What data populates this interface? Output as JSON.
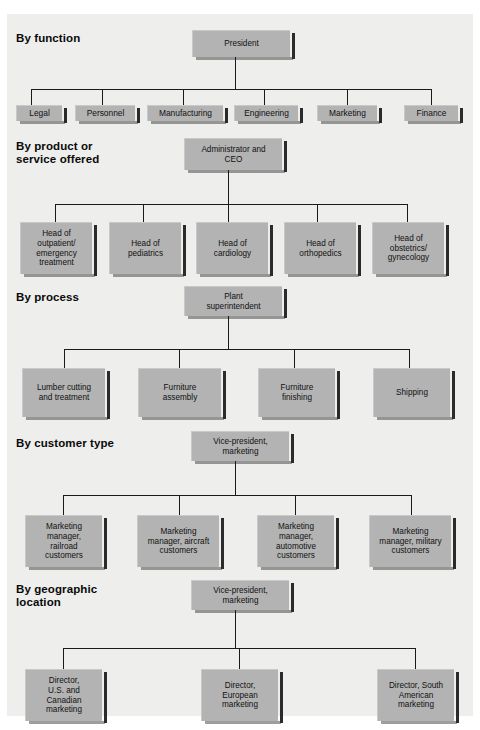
{
  "figure": {
    "kind": "organization-chart-collection",
    "panel_background": "#eeeeec",
    "node_fill": "#b3b3b3",
    "line_color": "#1a1a1a"
  },
  "sections": [
    {
      "id": "by-function",
      "title": "By function",
      "root": "President",
      "children": [
        "Legal",
        "Personnel",
        "Manufacturing",
        "Engineering",
        "Marketing",
        "Finance"
      ]
    },
    {
      "id": "by-product",
      "title": "By product or\nservice offered",
      "root": "Administrator and\nCEO",
      "children": [
        "Head of\noutpatient/\nemergency\ntreatment",
        "Head of\npediatrics",
        "Head of\ncardiology",
        "Head of\northopedics",
        "Head of\nobstetrics/\ngynecology"
      ]
    },
    {
      "id": "by-process",
      "title": "By process",
      "root": "Plant\nsuperintendent",
      "children": [
        "Lumber cutting\nand treatment",
        "Furniture\nassembly",
        "Furniture\nfinishing",
        "Shipping"
      ]
    },
    {
      "id": "by-customer-type",
      "title": "By customer type",
      "root": "Vice-president,\nmarketing",
      "children": [
        "Marketing\nmanager,\nrailroad\ncustomers",
        "Marketing\nmanager, aircraft\ncustomers",
        "Marketing\nmanager,\nautomotive\ncustomers",
        "Marketing\nmanager, military\ncustomers"
      ]
    },
    {
      "id": "by-geographic-location",
      "title": "By geographic\nlocation",
      "root": "Vice-president,\nmarketing",
      "children": [
        "Director,\nU.S. and\nCanadian\nmarketing",
        "Director,\nEuropean\nmarketing",
        "Director, South\nAmerican\nmarketing"
      ]
    }
  ]
}
